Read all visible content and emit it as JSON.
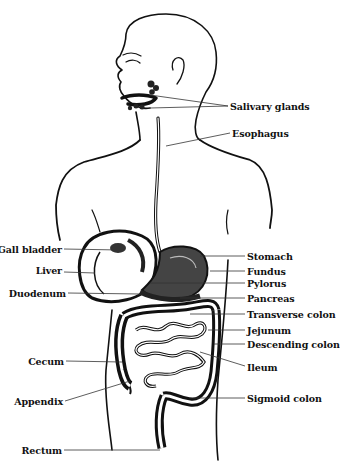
{
  "diagram": {
    "colors": {
      "ink": "#111111",
      "background": "#ffffff",
      "leader": "#333333"
    },
    "labels_right": [
      {
        "id": "salivary-glands",
        "text": "Salivary glands",
        "x": 230,
        "y": 101,
        "pointer_from": [
          [
            150,
            95
          ],
          [
            150,
            108
          ]
        ],
        "anchor": [
          228,
          106
        ]
      },
      {
        "id": "esophagus",
        "text": "Esophagus",
        "x": 232,
        "y": 128,
        "pointer_from": [
          [
            166,
            146
          ]
        ],
        "anchor": [
          230,
          133
        ]
      },
      {
        "id": "stomach",
        "text": "Stomach",
        "x": 247,
        "y": 251,
        "pointer_from": [
          [
            200,
            256
          ]
        ],
        "anchor": [
          245,
          256
        ]
      },
      {
        "id": "fundus",
        "text": "Fundus",
        "x": 247,
        "y": 266,
        "pointer_from": [
          [
            210,
            271
          ]
        ],
        "anchor": [
          245,
          271
        ]
      },
      {
        "id": "pylorus",
        "text": "Pylorus",
        "x": 247,
        "y": 278,
        "pointer_from": [
          [
            150,
            283
          ]
        ],
        "anchor": [
          245,
          283
        ]
      },
      {
        "id": "pancreas",
        "text": "Pancreas",
        "x": 247,
        "y": 293,
        "pointer_from": [
          [
            180,
            298
          ]
        ],
        "anchor": [
          245,
          298
        ]
      },
      {
        "id": "transverse-colon",
        "text": "Transverse colon",
        "x": 247,
        "y": 309,
        "pointer_from": [
          [
            190,
            314
          ]
        ],
        "anchor": [
          245,
          314
        ]
      },
      {
        "id": "jejunum",
        "text": "Jejunum",
        "x": 247,
        "y": 325,
        "pointer_from": [
          [
            208,
            330
          ]
        ],
        "anchor": [
          245,
          330
        ]
      },
      {
        "id": "descending-colon",
        "text": "Descending colon",
        "x": 247,
        "y": 339,
        "pointer_from": [
          [
            214,
            344
          ]
        ],
        "anchor": [
          245,
          344
        ]
      },
      {
        "id": "ileum",
        "text": "Ileum",
        "x": 247,
        "y": 362,
        "pointer_from": [
          [
            200,
            352
          ]
        ],
        "anchor": [
          245,
          366
        ]
      },
      {
        "id": "sigmoid-colon",
        "text": "Sigmoid colon",
        "x": 247,
        "y": 393,
        "pointer_from": [
          [
            190,
            398
          ]
        ],
        "anchor": [
          245,
          398
        ]
      }
    ],
    "labels_left": [
      {
        "id": "gall-bladder",
        "text": "Gall bladder",
        "x": 62,
        "y": 244,
        "pointer_to": [
          120,
          250
        ],
        "anchor": [
          64,
          249
        ]
      },
      {
        "id": "liver",
        "text": "Liver",
        "x": 62,
        "y": 265,
        "pointer_to": [
          95,
          273
        ],
        "anchor": [
          64,
          272
        ]
      },
      {
        "id": "duodenum",
        "text": "Duodenum",
        "x": 66,
        "y": 288,
        "pointer_to": [
          140,
          294
        ],
        "anchor": [
          68,
          293
        ]
      },
      {
        "id": "cecum",
        "text": "Cecum",
        "x": 64,
        "y": 356,
        "pointer_to": [
          122,
          362
        ],
        "anchor": [
          66,
          361
        ]
      },
      {
        "id": "appendix",
        "text": "Appendix",
        "x": 63,
        "y": 397,
        "pointer_to": [
          130,
          381
        ],
        "anchor": [
          65,
          401
        ]
      },
      {
        "id": "rectum",
        "text": "Rectum",
        "x": 62,
        "y": 445,
        "pointer_to": [
          160,
          450
        ],
        "anchor": [
          64,
          450
        ]
      }
    ]
  }
}
